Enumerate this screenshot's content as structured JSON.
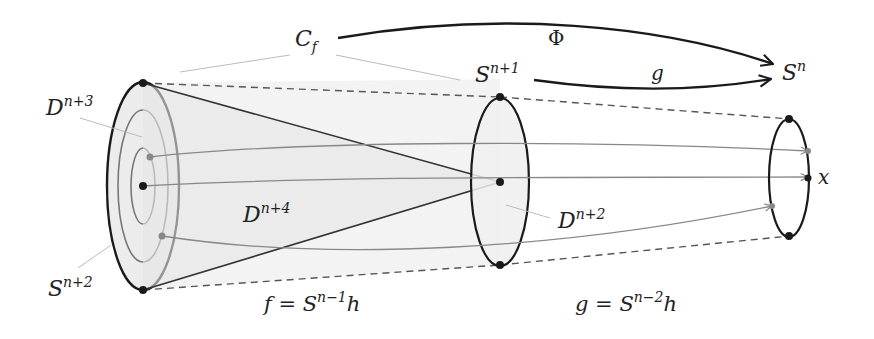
{
  "diagram": {
    "labels": {
      "cf": {
        "base": "C",
        "sub": "f"
      },
      "phi": "Φ",
      "g_arrow": "g",
      "sn": {
        "base": "S",
        "sup": "n"
      },
      "sn1": {
        "base": "S",
        "sup": "n+1"
      },
      "dn3": {
        "base": "D",
        "sup": "n+3"
      },
      "dn4": {
        "base": "D",
        "sup": "n+4"
      },
      "dn2": {
        "base": "D",
        "sup": "n+2"
      },
      "sn2": {
        "base": "S",
        "sup": "n+2"
      },
      "x": "x",
      "f_eq": {
        "lhs": "f = S",
        "sup": "n−1",
        "rhs": "h"
      },
      "g_eq": {
        "lhs": "g = S",
        "sup": "n−2",
        "rhs": "h"
      }
    },
    "colors": {
      "stroke_dark": "#1a1a1a",
      "stroke_gray": "#777777",
      "leader_gray": "#bbbbbb",
      "fill_light": "#f1f1f1",
      "dash": "#555555"
    }
  }
}
